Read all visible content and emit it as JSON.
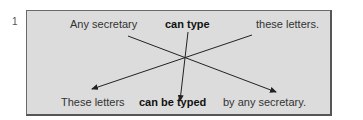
{
  "figure": {
    "number": "1",
    "active": {
      "subject": "Any secretary",
      "verb": "can type",
      "object": "these letters."
    },
    "passive": {
      "subject": "These letters",
      "verb": "can be typed",
      "agent": "by any secretary."
    },
    "colors": {
      "box_fill": "#dcdcdc",
      "border": "#6a6a6a",
      "line": "#222222"
    }
  }
}
